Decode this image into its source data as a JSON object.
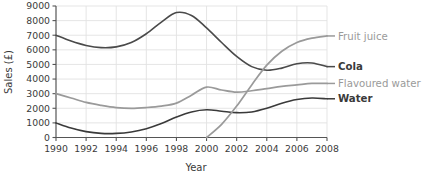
{
  "chart_data": {
    "type": "line",
    "title": "",
    "xlabel": "Year",
    "ylabel": "Sales (£)",
    "xlim": [
      1990,
      2008
    ],
    "ylim": [
      0,
      9000
    ],
    "grid": true,
    "legend_position": "right-of-plot-inline",
    "x_ticks": [
      "1990",
      "1992",
      "1994",
      "1996",
      "1998",
      "2000",
      "2002",
      "2004",
      "2006",
      "2008"
    ],
    "y_ticks": [
      "0",
      "1000",
      "2000",
      "3000",
      "4000",
      "5000",
      "6000",
      "7000",
      "8000",
      "9000"
    ],
    "x": [
      1990,
      1991,
      1992,
      1993,
      1994,
      1995,
      1996,
      1997,
      1998,
      1999,
      2000,
      2001,
      2002,
      2003,
      2004,
      2005,
      2006,
      2007,
      2008
    ],
    "series": [
      {
        "name": "Cola",
        "color": "#4a4a4a",
        "label_style": "dark",
        "values": [
          7000,
          6600,
          6300,
          6150,
          6200,
          6500,
          7100,
          7900,
          8550,
          8350,
          7500,
          6500,
          5550,
          4850,
          4600,
          4750,
          5050,
          5100,
          4850
        ]
      },
      {
        "name": "Flavoured water",
        "color": "#9a9a9a",
        "label_style": "light",
        "values": [
          3000,
          2700,
          2400,
          2200,
          2050,
          2000,
          2050,
          2150,
          2350,
          2900,
          3450,
          3250,
          3100,
          3200,
          3350,
          3500,
          3600,
          3700,
          3700
        ]
      },
      {
        "name": "Water",
        "color": "#3a3a3a",
        "label_style": "dark",
        "values": [
          1000,
          650,
          400,
          280,
          280,
          380,
          600,
          950,
          1400,
          1750,
          1900,
          1800,
          1700,
          1750,
          2000,
          2350,
          2600,
          2700,
          2650
        ]
      },
      {
        "name": "Fruit juice",
        "color": "#9a9a9a",
        "label_style": "light",
        "values": [
          null,
          null,
          null,
          null,
          null,
          null,
          null,
          null,
          null,
          null,
          0,
          900,
          2150,
          3600,
          4950,
          5900,
          6500,
          6800,
          6950
        ]
      }
    ]
  },
  "series_labels": [
    {
      "text": "Fruit juice",
      "style": "light"
    },
    {
      "text": "Cola",
      "style": "dark"
    },
    {
      "text": "Flavoured water",
      "style": "light"
    },
    {
      "text": "Water",
      "style": "dark"
    }
  ],
  "colors": {
    "cola": "#4a4a4a",
    "flavoured_water": "#9a9a9a",
    "water": "#3a3a3a",
    "fruit_juice": "#9a9a9a",
    "axis": "#555555",
    "grid": "#e2e2e2",
    "background": "#ffffff"
  }
}
